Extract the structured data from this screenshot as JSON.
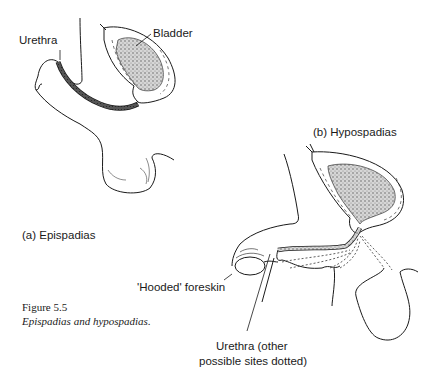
{
  "figure": {
    "number": "Figure 5.5",
    "caption": "Epispadias and hypospadias."
  },
  "panel_a": {
    "title": "(a)  Epispadias",
    "labels": {
      "urethra": "Urethra",
      "bladder": "Bladder"
    }
  },
  "panel_b": {
    "title": "(b)  Hypospadias",
    "labels": {
      "hooded_foreskin": "'Hooded' foreskin",
      "urethra_line1": "Urethra (other",
      "urethra_line2": "possible sites dotted)"
    }
  },
  "colors": {
    "ink": "#1a1a1a",
    "stipple": "#9a9a9a",
    "background": "#ffffff"
  }
}
